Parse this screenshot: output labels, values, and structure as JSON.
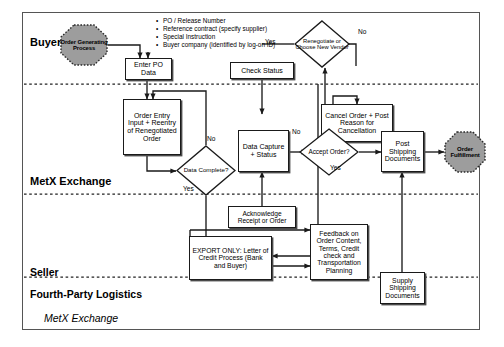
{
  "diagram": {
    "caption": "MetX Exchange",
    "lanes": [
      {
        "id": "buyer",
        "label": "Buyer"
      },
      {
        "id": "metx",
        "label": "MetX Exchange"
      },
      {
        "id": "seller",
        "label": "Seller"
      },
      {
        "id": "fourth_party",
        "label": "Fourth-Party Logistics"
      }
    ],
    "annotations": {
      "po_bullets": [
        "PO / Release Number",
        "Reference contract (specify supplier)",
        "Special Instruction",
        "Buyer company (identified by log-on ID)"
      ]
    },
    "nodes": {
      "order_generating_process": "Order Generating Process",
      "enter_po_data": "Enter PO Data",
      "check_status": "Check Status",
      "renegotiate_or_choose_new_vendor": "Renegotiate or Choose New Vendor",
      "cancel_order": "Cancel Order + Post Reason for Cancellation",
      "order_entry_input": "Order Entry Input + Reentry of Renegotiated Order",
      "data_complete": "Data Complete?",
      "data_capture_status": "Data Capture + Status",
      "accept_order": "Accept Order?",
      "post_shipping_documents": "Post Shipping Documents",
      "order_fulfillment": "Order Fulfillment",
      "acknowledge_receipt": "Acknowledge Receipt or Order",
      "export_only": "EXPORT ONLY: Letter of Credit Process (Bank and Buyer)",
      "feedback": "Feedback on Order Content, Terms, Credit check and Transportation Planning",
      "supply_shipping_documents": "Supply Shipping Documents"
    },
    "edge_labels": {
      "renegotiate_yes": "Yes",
      "renegotiate_no": "No",
      "data_complete_no": "No",
      "data_complete_yes": "Yes",
      "accept_order_no": "No",
      "accept_order_yes": "Yes"
    },
    "colors": {
      "terminator_fill": "#9d9d9d",
      "node_stroke": "#1a1a1a",
      "shadow": "#4a4a4a",
      "frame": "#555555",
      "background": "#ffffff"
    }
  }
}
